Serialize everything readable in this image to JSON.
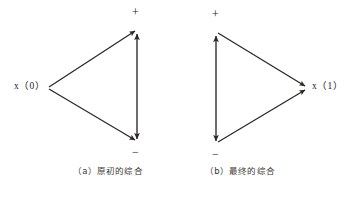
{
  "figure": {
    "background_color": "#ffffff",
    "line_color": "#2a2725",
    "text_color": "#23201e"
  },
  "diagram_a": {
    "caption": "（a）原初的综合",
    "nodes": {
      "source_label": "x（0）",
      "plus_label": "+",
      "minus_label": "−"
    },
    "vertices": {
      "left": [
        47,
        88
      ],
      "top": [
        136,
        29
      ],
      "bottom": [
        137,
        142
      ]
    },
    "edges": [
      {
        "name": "source-to-plus",
        "from": "left",
        "to": "top",
        "arrows": "end"
      },
      {
        "name": "source-to-minus",
        "from": "left",
        "to": "bottom",
        "arrows": "end"
      },
      {
        "name": "plus-minus-vertical",
        "from": "top",
        "to": "bottom",
        "arrows": "both"
      }
    ]
  },
  "diagram_b": {
    "caption": "（b）最终的综合",
    "nodes": {
      "target_label": "x（1）",
      "plus_label": "+",
      "minus_label": "−"
    },
    "vertices": {
      "top": [
        216,
        31
      ],
      "bottom": [
        216,
        144
      ],
      "right": [
        307,
        88
      ]
    },
    "edges": [
      {
        "name": "plus-to-target",
        "from": "top",
        "to": "right",
        "arrows": "end"
      },
      {
        "name": "minus-to-target",
        "from": "bottom",
        "to": "right",
        "arrows": "end"
      },
      {
        "name": "plus-minus-vertical",
        "from": "top",
        "to": "bottom",
        "arrows": "both"
      }
    ]
  }
}
